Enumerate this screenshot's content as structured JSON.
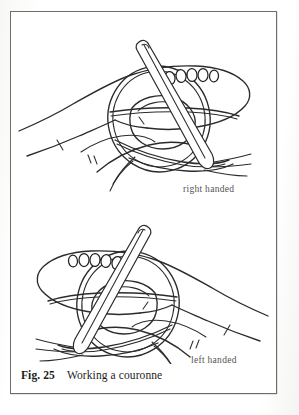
{
  "figure": {
    "caption_number": "Fig. 25",
    "caption_text": "Working a couronne",
    "border_color": "#6d6d6d",
    "ink_color": "#2b2b2b",
    "background_color": "#ffffff"
  },
  "illustrations": [
    {
      "id": "right-handed-diagram",
      "label": "right handed",
      "position": "top",
      "depicts": "hand holding a needle working a couronne ring of loops with beads/stitches along the top edge"
    },
    {
      "id": "left-handed-diagram",
      "label": "left handed",
      "position": "bottom",
      "depicts": "mirrored hand holding a needle working a couronne ring of loops with beads/stitches along the top edge"
    }
  ]
}
